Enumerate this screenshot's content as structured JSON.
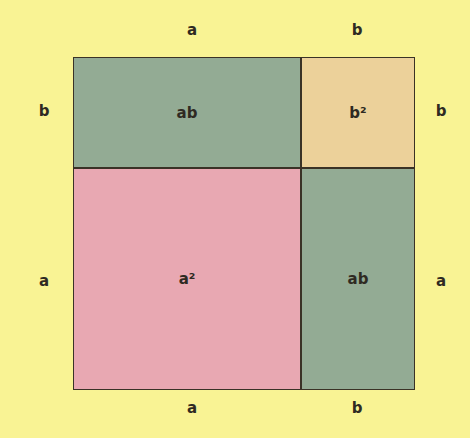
{
  "diagram": {
    "title": "",
    "labels": {
      "top": [
        "a",
        "b"
      ],
      "bottom": [
        "a",
        "b"
      ],
      "left": [
        "b",
        "a"
      ],
      "right": [
        "b",
        "a"
      ]
    },
    "regions": {
      "top_left": {
        "label": "ab",
        "color": "#93ab94"
      },
      "top_right": {
        "label": "b²",
        "color": "#ecd19a"
      },
      "bottom_left": {
        "label": "a²",
        "color": "#e8a8b2"
      },
      "bottom_right": {
        "label": "ab",
        "color": "#93ab94"
      }
    },
    "background": "#f9f394",
    "border_color": "#3a3226"
  }
}
